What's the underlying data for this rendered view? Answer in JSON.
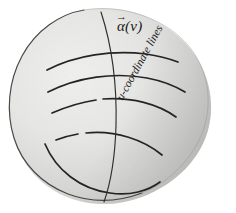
{
  "figure": {
    "labels": {
      "alpha_curve": "(v)",
      "alpha_symbol": "α",
      "alpha_arrow": "→",
      "u_coordinate_lines": "u-coordinate lines"
    },
    "colors": {
      "blob_fill_light": "#ebebe9",
      "blob_fill_mid": "#dededc",
      "blob_fill_dark": "#c2c2c0",
      "outline": "#2b2b2b",
      "curve": "#262626",
      "background": "#ffffff",
      "text": "#1a1a1a"
    },
    "geometry": {
      "blob_outline": "M 84,10 C 120,4 152,14 178,36 C 206,60 216,96 209,126 C 202,158 176,184 142,197 C 110,209 74,206 47,186 C 20,166 7,132 9,100 C 11,66 30,33 60,18 Z",
      "v_curve": "M 101,12 C 112,46 117,88 116,126 C 115,158 111,182 104,202",
      "u_curves": [
        {
          "name": "u-line-1",
          "segments": [
            "M 47,70 C 76,55 112,50 146,54 C 160,56 170,59 178,62"
          ]
        },
        {
          "name": "u-line-2",
          "segments": [
            "M 48,92 C 78,77 114,72 147,78 C 163,81 175,86 185,92"
          ]
        },
        {
          "name": "u-line-3",
          "segments": [
            "M 52,113 C 66,107 82,102 96,100",
            "M 103,99 C 132,97 158,104 176,117"
          ]
        },
        {
          "name": "u-line-4",
          "segments": [
            "M 56,140 C 64,137 72,135 78,134",
            "M 86,133 C 116,130 144,140 162,155"
          ]
        },
        {
          "name": "u-line-5",
          "segments": [
            "M 45,144 C 56,170 80,189 110,193 C 130,196 148,191 160,182"
          ]
        }
      ]
    }
  }
}
